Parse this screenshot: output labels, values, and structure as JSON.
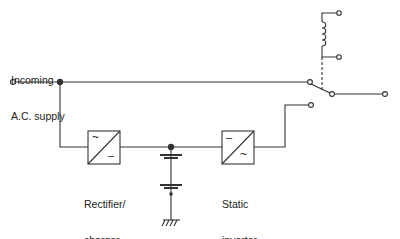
{
  "diagram": {
    "labels": {
      "incoming_line1": "Incoming",
      "incoming_line2": "A.C. supply",
      "rectifier_line1": "Rectifier/",
      "rectifier_line2": "charger",
      "inverter_line1": "Static",
      "inverter_line2": "inverter"
    },
    "symbols": {
      "rectifier_top": "~",
      "rectifier_bottom": "–",
      "inverter_top": "–",
      "inverter_bottom": "~"
    },
    "colors": {
      "line": "#333333",
      "background": "#ffffff"
    }
  }
}
